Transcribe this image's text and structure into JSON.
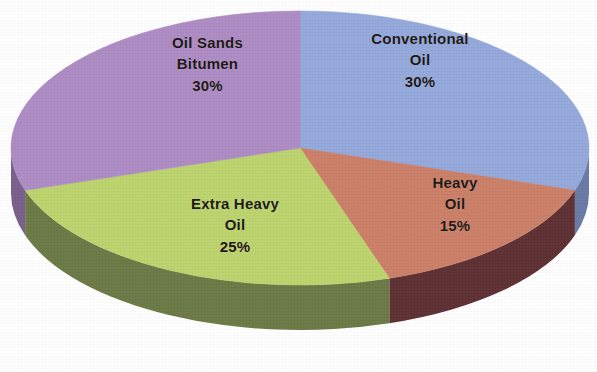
{
  "chart_data": {
    "type": "pie",
    "title": "",
    "subtitle": "",
    "xlabel": "",
    "ylabel": "",
    "legend_position": "none",
    "grid": false,
    "labels_on_slices": true,
    "style": "3d-pie",
    "units": "percent",
    "total": 100,
    "categories": [
      "Conventional Oil",
      "Heavy Oil",
      "Extra Heavy Oil",
      "Oil Sands Bitumen"
    ],
    "values": [
      30,
      15,
      25,
      30
    ],
    "slices": [
      {
        "name": "Conventional Oil",
        "label_lines": [
          "Conventional",
          "Oil",
          "30%"
        ],
        "value": 30,
        "value_text": "30%",
        "color": "#94a9dc",
        "side_color": "#6b7aa6",
        "start_angle": 0,
        "end_angle": 108
      },
      {
        "name": "Heavy Oil",
        "label_lines": [
          "Heavy",
          "Oil",
          "15%"
        ],
        "value": 15,
        "value_text": "15%",
        "color": "#cb7f68",
        "side_color": "#5e3034",
        "start_angle": 108,
        "end_angle": 162
      },
      {
        "name": "Extra Heavy Oil",
        "label_lines": [
          "Extra Heavy",
          "Oil",
          "25%"
        ],
        "value": 25,
        "value_text": "25%",
        "color": "#bcd46e",
        "side_color": "#6b7a45",
        "start_angle": 162,
        "end_angle": 252
      },
      {
        "name": "Oil Sands Bitumen",
        "label_lines": [
          "Oil Sands",
          "Bitumen",
          "30%"
        ],
        "value": 30,
        "value_text": "30%",
        "color": "#ae8cc4",
        "side_color": "#7a5f8c",
        "start_angle": 252,
        "end_angle": 360
      }
    ],
    "colors": {
      "conventional_oil": "#94a9dc",
      "heavy_oil": "#cb7f68",
      "extra_heavy_oil": "#bcd46e",
      "oil_sands_bitumen": "#ae8cc4",
      "background": "#ffffff",
      "label_text": "#1b1714"
    },
    "geometry": {
      "center_x": 300,
      "center_y": 148,
      "radius_x": 289,
      "radius_y": 137,
      "depth": 45,
      "start_angle_deg": 0
    }
  },
  "labels": {
    "conventional_oil": {
      "line1": "Conventional",
      "line2": "Oil",
      "line3": "30%"
    },
    "heavy_oil": {
      "line1": "Heavy",
      "line2": "Oil",
      "line3": "15%"
    },
    "extra_heavy_oil": {
      "line1": "Extra Heavy",
      "line2": "Oil",
      "line3": "25%"
    },
    "oil_sands_bitumen": {
      "line1": "Oil Sands",
      "line2": "Bitumen",
      "line3": "30%"
    }
  }
}
